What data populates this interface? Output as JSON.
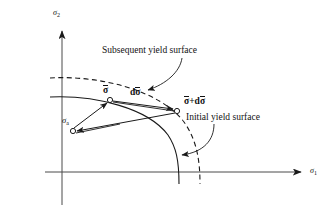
{
  "figure": {
    "type": "technical-diagram",
    "background_color": "#ffffff",
    "line_color": "#1a1a1a"
  },
  "axes": {
    "x_label": "σ",
    "x_subscript": "1",
    "y_label": "σ",
    "y_subscript": "2",
    "origin_px": [
      62,
      172
    ],
    "x_axis_end_px": [
      308,
      172
    ],
    "y_axis_end_px": [
      62,
      24
    ]
  },
  "annotations": {
    "subsequent_surface": "Subsequent yield surface",
    "initial_surface": "Initial yield surface"
  },
  "vectors": {
    "sigma_bar": "σ",
    "d_sigma_bar": "dσ",
    "sigma_bar_plus_d": "σ+dσ",
    "back_stress": "σ",
    "back_stress_sub": "a"
  },
  "points": {
    "sigma_bar_px": [
      110,
      100
    ],
    "sigma_bar_plus_d_px": [
      177,
      110
    ],
    "back_stress_px": [
      72,
      130
    ]
  },
  "curves": {
    "initial_yield_surface": {
      "style": "solid",
      "description": "quarter-ellipse arc from left of vertical axis down to the horizontal axis"
    },
    "subsequent_yield_surface": {
      "style": "dashed",
      "description": "translated quarter-ellipse arc, shifted up and right"
    }
  }
}
